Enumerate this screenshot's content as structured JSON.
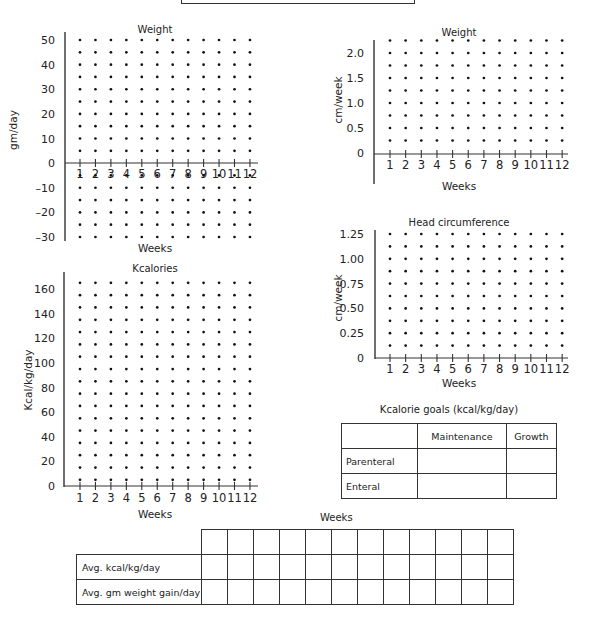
{
  "header_box": {
    "text": ""
  },
  "chart_data": [
    {
      "id": "weight_gm",
      "type": "scatter",
      "title": "Weight",
      "xlabel": "Weeks",
      "ylabel": "gm/day",
      "x_ticks": [
        1,
        2,
        3,
        4,
        5,
        6,
        7,
        8,
        9,
        10,
        11,
        12
      ],
      "y_ticks": [
        50,
        40,
        30,
        20,
        10,
        0,
        -10,
        -20,
        -30
      ],
      "ylim": [
        -30,
        50
      ],
      "grid": "dot grid at every 5 gm/day (blank worksheet)",
      "series": []
    },
    {
      "id": "weight_cm",
      "type": "scatter",
      "title": "Weight",
      "xlabel": "Weeks",
      "ylabel": "cm/week",
      "x_ticks": [
        1,
        2,
        3,
        4,
        5,
        6,
        7,
        8,
        9,
        10,
        11,
        12
      ],
      "y_ticks": [
        "2.0",
        "1.5",
        "1.0",
        "0.5",
        "0"
      ],
      "ylim": [
        0,
        2.25
      ],
      "grid": "dot grid at every 0.25 cm/week (blank worksheet)",
      "series": []
    },
    {
      "id": "head_circumference",
      "type": "scatter",
      "title": "Head circumference",
      "xlabel": "Weeks",
      "ylabel": "cm/week",
      "x_ticks": [
        1,
        2,
        3,
        4,
        5,
        6,
        7,
        8,
        9,
        10,
        11,
        12
      ],
      "y_ticks": [
        "1.25",
        "1.00",
        "0.75",
        "0.50",
        "0.25",
        "0"
      ],
      "ylim": [
        0,
        1.25
      ],
      "grid": "dot grid at every 0.125 cm/week (blank worksheet)",
      "series": []
    },
    {
      "id": "kcalories",
      "type": "scatter",
      "title": "Kcalories",
      "xlabel": "Weeks",
      "ylabel": "Kcal/kg/day",
      "x_ticks": [
        1,
        2,
        3,
        4,
        5,
        6,
        7,
        8,
        9,
        10,
        11,
        12
      ],
      "y_ticks": [
        160,
        140,
        120,
        100,
        80,
        60,
        40,
        20,
        0
      ],
      "ylim": [
        0,
        165
      ],
      "grid": "dot grid at every 10 kcal/kg/day (blank worksheet)",
      "series": []
    }
  ],
  "goals": {
    "title": "Kcalorie goals (kcal/kg/day)",
    "columns": [
      "",
      "Maintenance",
      "Growth"
    ],
    "rows": [
      {
        "label": "Parenteral",
        "maintenance": "",
        "growth": ""
      },
      {
        "label": "Enteral",
        "maintenance": "",
        "growth": ""
      }
    ]
  },
  "summary": {
    "title": "Weeks",
    "rows": [
      {
        "label": "Avg. kcal/kg/day",
        "values": [
          "",
          "",
          "",
          "",
          "",
          "",
          "",
          "",
          "",
          "",
          "",
          ""
        ]
      },
      {
        "label": "Avg. gm weight gain/day",
        "values": [
          "",
          "",
          "",
          "",
          "",
          "",
          "",
          "",
          "",
          "",
          "",
          ""
        ]
      }
    ]
  }
}
